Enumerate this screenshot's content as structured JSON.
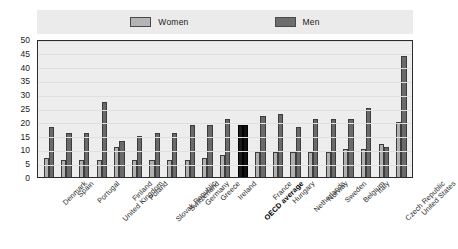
{
  "legend": {
    "items": [
      {
        "label": "Women",
        "color": "#b0b0b0",
        "key": "women"
      },
      {
        "label": "Men",
        "color": "#6a6a6a",
        "key": "men"
      }
    ]
  },
  "axis": {
    "y_ticks": [
      "0",
      "5",
      "10",
      "15",
      "20",
      "25",
      "30",
      "35",
      "40",
      "45",
      "50"
    ]
  },
  "chart_data": {
    "type": "bar",
    "title": "",
    "xlabel": "",
    "ylabel": "",
    "ylim": [
      0,
      50
    ],
    "ytick_step": 5,
    "grid": true,
    "legend_position": "top-center",
    "highlight_category": "OECD average",
    "categories": [
      "Denmark",
      "Spain",
      "Portugal",
      "United Kingdom",
      "Finland",
      "Poland",
      "Slovak Republic",
      "Switzerland",
      "Germany",
      "Greece",
      "Ireland",
      "OECD average",
      "France",
      "Hungary",
      "Netherlands",
      "Norway",
      "Sweden",
      "Belgium",
      "Italy",
      "Czech Republic",
      "United States"
    ],
    "series": [
      {
        "name": "Women",
        "color": "#b0b0b0",
        "values": [
          7,
          6,
          6,
          6,
          11,
          6,
          6,
          6,
          6,
          7,
          8,
          19,
          9,
          9,
          9,
          9,
          9,
          10,
          10,
          12,
          20
        ]
      },
      {
        "name": "Men",
        "color": "#6a6a6a",
        "values": [
          18,
          16,
          16,
          27,
          13,
          15,
          16,
          16,
          19,
          19,
          21,
          19,
          22,
          23,
          18,
          21,
          21,
          21,
          25,
          11,
          44
        ]
      }
    ]
  }
}
